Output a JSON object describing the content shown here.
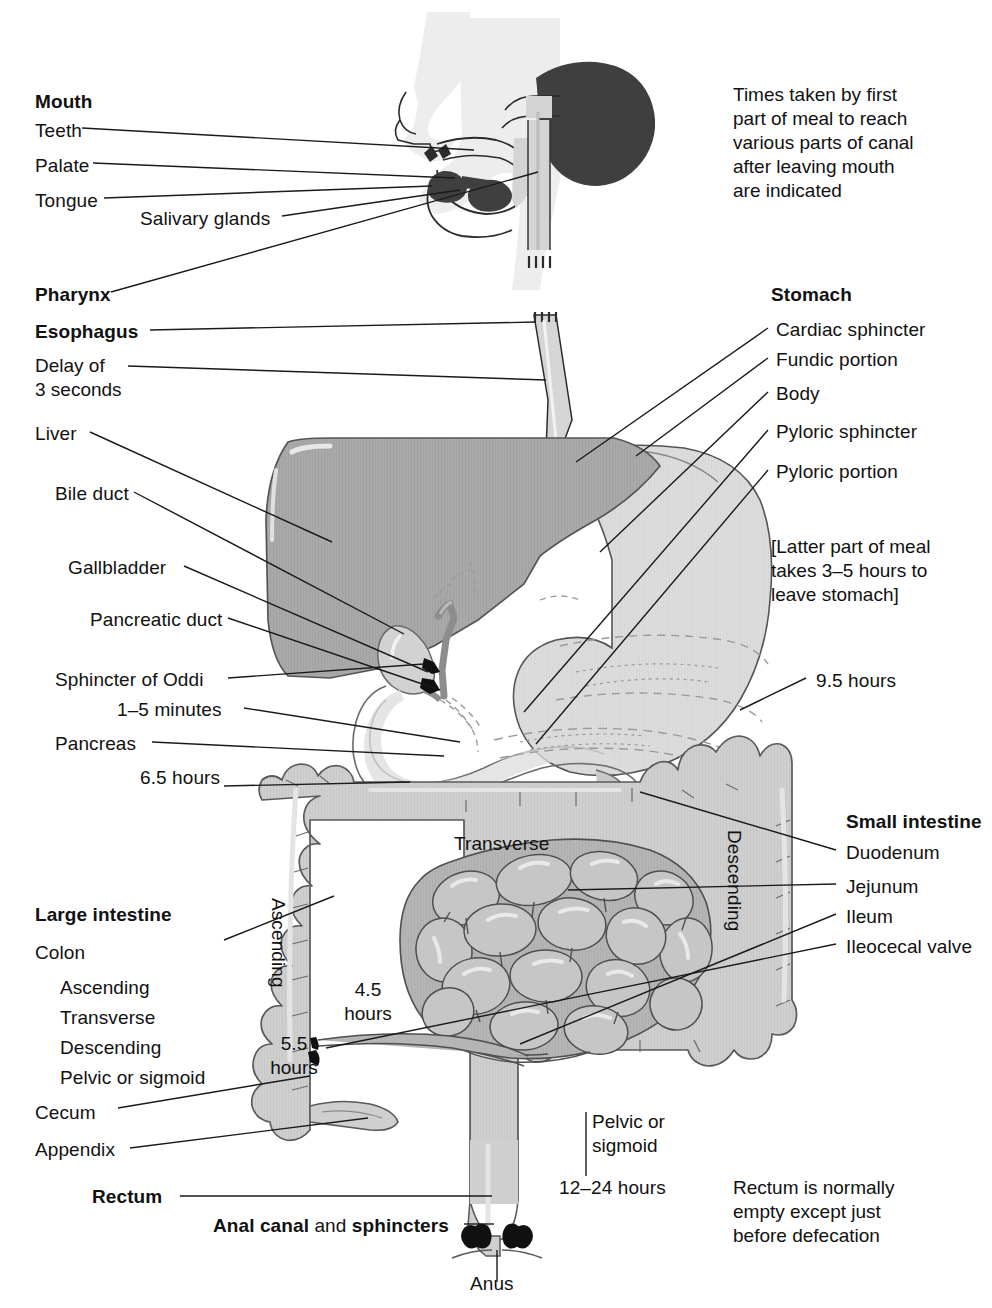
{
  "colors": {
    "ink": "#111111",
    "line": "#1a1a1a",
    "liver": "#a9a9a9",
    "stomach": "#dcdcdc",
    "colon": "#cfcfcf",
    "colon_dark": "#bdbdbd",
    "small_intestine": "#c2c2c2",
    "head": "#eaeaea",
    "dark_organ": "#4a4a4a",
    "black": "#111111"
  },
  "notes": {
    "top_right": "Times taken by first\npart of meal to reach\nvarious parts of canal\nafter leaving mouth\nare indicated",
    "stomach_bracket": "[Latter part of meal\ntakes 3–5 hours to\nleave stomach]",
    "rectum_note": "Rectum is normally\nempty except just\nbefore defecation"
  },
  "mouth_group": {
    "heading": "Mouth",
    "items": [
      "Teeth",
      "Palate",
      "Tongue"
    ],
    "salivary": "Salivary glands"
  },
  "upper_tract": {
    "pharynx": "Pharynx",
    "esophagus": "Esophagus",
    "delay": "Delay of\n3 seconds"
  },
  "accessory_organs": {
    "liver": "Liver",
    "bile_duct": "Bile duct",
    "gallbladder": "Gallbladder",
    "pancreatic_duct": "Pancreatic duct",
    "sphincter_of_oddi": "Sphincter of Oddi",
    "oddi_time": "1–5 minutes",
    "pancreas": "Pancreas"
  },
  "stomach_group": {
    "heading": "Stomach",
    "items": [
      "Cardiac sphincter",
      "Fundic portion",
      "Body",
      "Pyloric sphincter",
      "Pyloric portion"
    ]
  },
  "small_intestine_group": {
    "heading": "Small intestine",
    "items": [
      "Duodenum",
      "Jejunum",
      "Ileum",
      "Ileocecal valve"
    ]
  },
  "large_intestine_group": {
    "heading": "Large intestine",
    "colon": "Colon",
    "colon_parts": [
      "Ascending",
      "Transverse",
      "Descending",
      "Pelvic or sigmoid"
    ],
    "cecum": "Cecum",
    "appendix": "Appendix"
  },
  "terminal_group": {
    "rectum": "Rectum",
    "anal_canal_bold_1": "Anal canal",
    "anal_canal_mid": " and ",
    "anal_canal_bold_2": "sphincters",
    "anus": "Anus"
  },
  "inline_labels": {
    "transverse": "Transverse",
    "ascending": "Ascending",
    "descending": "Descending",
    "pelvic_or_sigmoid": "Pelvic or\nsigmoid"
  },
  "transit_times": {
    "t_9_5": "9.5 hours",
    "t_6_5": "6.5 hours",
    "t_4_5": "4.5\nhours",
    "t_5_5": "5.5\nhours",
    "t_12_24": "12–24 hours"
  }
}
